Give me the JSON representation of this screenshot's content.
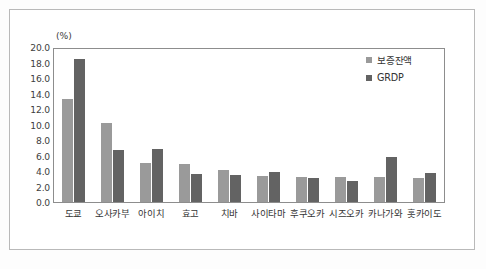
{
  "chart_data": {
    "type": "bar",
    "title": "",
    "subtitle": "",
    "unit_label": "(%)",
    "xlabel": "",
    "ylabel": "",
    "ylim": [
      0.0,
      20.0
    ],
    "ytick_step": 2.0,
    "yticks": [
      "20.0",
      "18.0",
      "16.0",
      "14.0",
      "12.0",
      "10.0",
      "8.0",
      "6.0",
      "4.0",
      "2.0",
      "0.0"
    ],
    "grid": false,
    "legend_position": "top-right",
    "categories": [
      "도쿄",
      "오사카부",
      "아이치",
      "효고",
      "치바",
      "사이타마",
      "후쿠오카",
      "시즈오카",
      "카나가와",
      "홋카이도"
    ],
    "series": [
      {
        "name": "보증잔액",
        "color": "#9a9a9a",
        "values": [
          13.5,
          10.3,
          5.1,
          5.0,
          4.2,
          3.4,
          3.3,
          3.3,
          3.3,
          3.2
        ]
      },
      {
        "name": "GRDP",
        "color": "#636363",
        "values": [
          18.7,
          6.8,
          6.9,
          3.6,
          3.5,
          3.9,
          3.2,
          2.7,
          5.9,
          3.8
        ]
      }
    ]
  },
  "colors": {
    "series_1": "#9a9a9a",
    "series_2": "#636363",
    "axis": "#8d8d8d",
    "outer_frame": "#b9b9b9",
    "text": "#353535",
    "background": "#ffffff"
  }
}
